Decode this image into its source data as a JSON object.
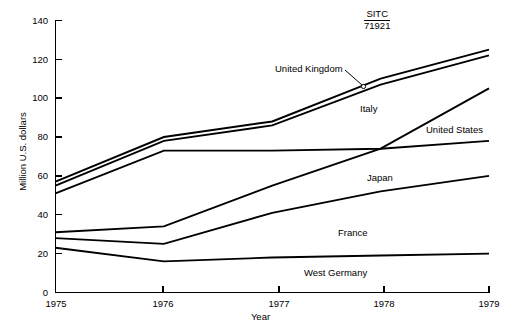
{
  "chart_data": {
    "type": "line",
    "title": "",
    "annotation": {
      "label": "SITC",
      "code": "71921"
    },
    "xlabel": "Year",
    "ylabel": "Million U.S. dollars",
    "categories": [
      "1975",
      "1976",
      "1977",
      "1978",
      "1979"
    ],
    "x": [
      1975,
      1976,
      1977,
      1978,
      1979
    ],
    "xlim": [
      1975,
      1979
    ],
    "ylim": [
      0,
      140
    ],
    "yticks": [
      0,
      20,
      40,
      60,
      80,
      100,
      120,
      140
    ],
    "grid": false,
    "legend_position": "inline-labels",
    "series": [
      {
        "name": "United Kingdom",
        "values": [
          57,
          80,
          88,
          110,
          125
        ]
      },
      {
        "name": "Italy",
        "values": [
          55,
          78,
          86,
          107,
          122
        ]
      },
      {
        "name": "United States",
        "values": [
          51,
          73,
          73,
          74,
          78
        ]
      },
      {
        "name": "Japan",
        "values": [
          31,
          34,
          55,
          74,
          105
        ]
      },
      {
        "name": "France",
        "values": [
          28,
          25,
          41,
          52,
          60
        ]
      },
      {
        "name": "West Germany",
        "values": [
          23,
          16,
          18,
          19,
          20
        ]
      }
    ]
  },
  "labels": {
    "united_kingdom": "United Kingdom",
    "italy": "Italy",
    "united_states": "United States",
    "japan": "Japan",
    "france": "France",
    "west_germany": "West Germany"
  },
  "axis": {
    "y_title": "Million U.S. dollars",
    "x_title": "Year",
    "y_ticks": [
      "0",
      "20",
      "40",
      "60",
      "80",
      "100",
      "120",
      "140"
    ],
    "x_ticks": [
      "1975",
      "1976",
      "1977",
      "1978",
      "1979"
    ]
  },
  "annotation": {
    "sitc_label": "SITC",
    "sitc_code": "71921"
  },
  "colors": {
    "line": "#000000",
    "background": "#ffffff",
    "text": "#000000"
  }
}
